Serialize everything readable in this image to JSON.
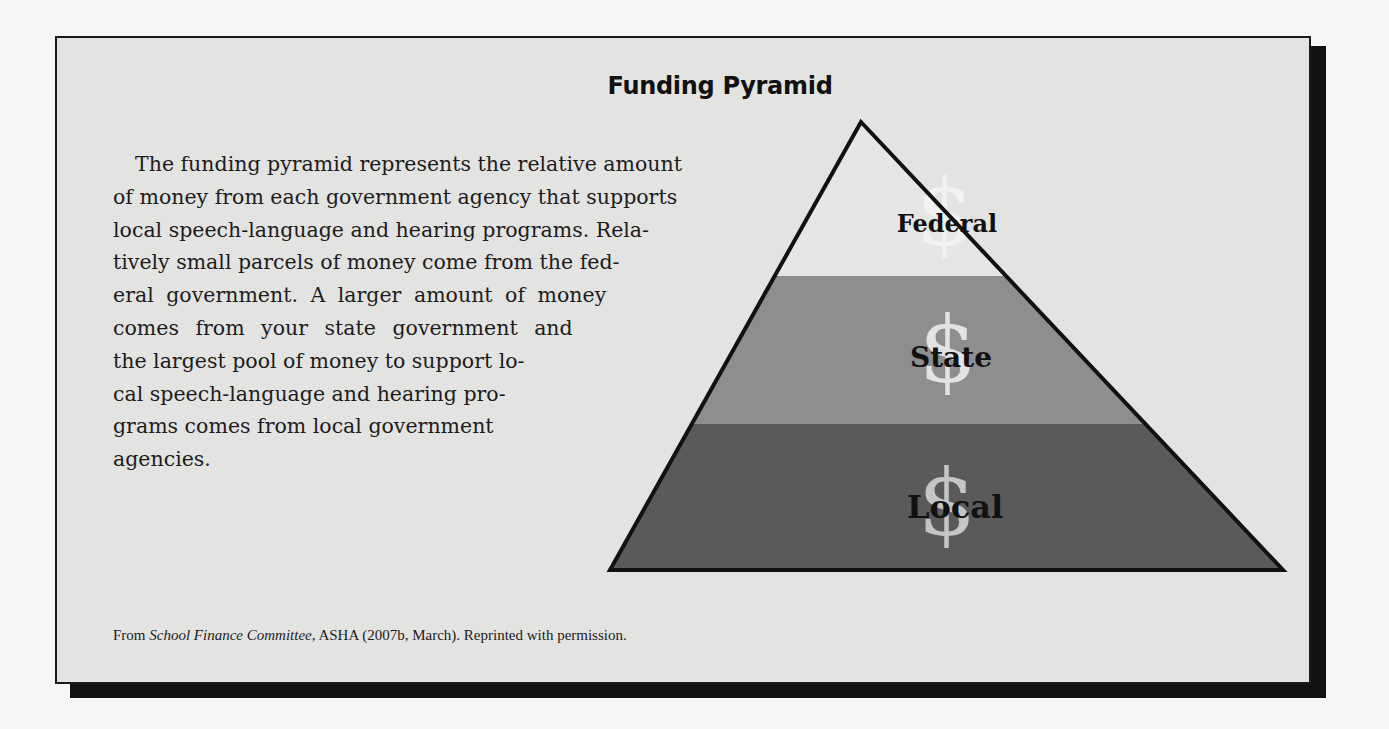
{
  "figure": {
    "title": "Funding Pyramid",
    "body_lines": [
      "The funding pyramid represents the relative amount",
      "of money from each government agency that supports",
      "local speech-language and hearing programs. Rela-",
      "tively small parcels of money come from the fed-",
      "eral government. A larger amount of money",
      "comes from your state government and",
      "the largest pool of money to support lo-",
      "cal speech-language and hearing pro-",
      "grams comes from local government",
      "agencies."
    ],
    "caption": {
      "prefix": "From ",
      "italic": "School Finance Committee,",
      "suffix": " ASHA (2007b, March). Reprinted with permission."
    },
    "pyramid": {
      "tiers": [
        {
          "label": "Federal",
          "symbol": "$",
          "color": "#e6e6e4"
        },
        {
          "label": "State",
          "symbol": "$",
          "color": "#8e8e8e"
        },
        {
          "label": "Local",
          "symbol": "$",
          "color": "#5a5a5a"
        }
      ],
      "outline_color": "#111111"
    }
  }
}
